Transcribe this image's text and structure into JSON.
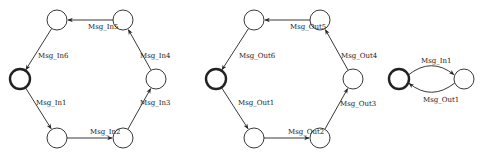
{
  "diagrams": [
    {
      "name": "input-cycle",
      "nodes": [
        {
          "id": "i0",
          "x": 20,
          "y": 79,
          "initial": true
        },
        {
          "id": "i1",
          "x": 57,
          "y": 138
        },
        {
          "id": "i2",
          "x": 123,
          "y": 138
        },
        {
          "id": "i3",
          "x": 156,
          "y": 79
        },
        {
          "id": "i4",
          "x": 123,
          "y": 20
        },
        {
          "id": "i5",
          "x": 57,
          "y": 20
        }
      ],
      "edges": [
        {
          "from": "i0",
          "to": "i1",
          "label": "Msg_In1",
          "lx": 36,
          "ly": 105
        },
        {
          "from": "i1",
          "to": "i2",
          "label": "Msg_In2",
          "lx": 90,
          "ly": 134
        },
        {
          "from": "i2",
          "to": "i3",
          "label": "Msg_In3",
          "lx": 140,
          "ly": 105
        },
        {
          "from": "i3",
          "to": "i4",
          "label": "Msg_In4",
          "lx": 140,
          "ly": 58
        },
        {
          "from": "i4",
          "to": "i5",
          "label": "Msg_In5",
          "lx": 88,
          "ly": 29
        },
        {
          "from": "i5",
          "to": "i0",
          "label": "Msg_In6",
          "lx": 38,
          "ly": 58
        }
      ]
    },
    {
      "name": "output-cycle",
      "nodes": [
        {
          "id": "o0",
          "x": 216,
          "y": 79,
          "initial": true
        },
        {
          "id": "o1",
          "x": 254,
          "y": 138
        },
        {
          "id": "o2",
          "x": 320,
          "y": 138
        },
        {
          "id": "o3",
          "x": 353,
          "y": 79
        },
        {
          "id": "o4",
          "x": 320,
          "y": 20
        },
        {
          "id": "o5",
          "x": 254,
          "y": 20
        }
      ],
      "edges": [
        {
          "from": "o0",
          "to": "o1",
          "label": "Msg_Out1",
          "lx": 238,
          "ly": 105
        },
        {
          "from": "o1",
          "to": "o2",
          "label": "Msg_Out2",
          "lx": 288,
          "ly": 134
        },
        {
          "from": "o2",
          "to": "o3",
          "label": "Msg_Out3",
          "lx": 340,
          "ly": 106
        },
        {
          "from": "o3",
          "to": "o4",
          "label": "Msg_Out4",
          "lx": 341,
          "ly": 58
        },
        {
          "from": "o4",
          "to": "o5",
          "label": "Msg_Out5",
          "lx": 290,
          "ly": 29
        },
        {
          "from": "o5",
          "to": "o0",
          "label": "Msg_Out6",
          "lx": 239,
          "ly": 58
        }
      ]
    },
    {
      "name": "pair-cycle",
      "nodes": [
        {
          "id": "p0",
          "x": 399,
          "y": 79,
          "initial": true
        },
        {
          "id": "p1",
          "x": 464,
          "y": 79
        }
      ],
      "edges": [
        {
          "from": "p0",
          "to": "p1",
          "label": "Msg_In1",
          "curve": -14,
          "lx": 421,
          "ly": 63
        },
        {
          "from": "p1",
          "to": "p0",
          "label": "Msg_Out1",
          "curve": 14,
          "lx": 423,
          "ly": 102
        }
      ]
    }
  ],
  "style": {
    "stroke": "#222222",
    "node_radius": 10,
    "initial_stroke_width": 2.4,
    "normal_stroke_width": 0.9
  }
}
